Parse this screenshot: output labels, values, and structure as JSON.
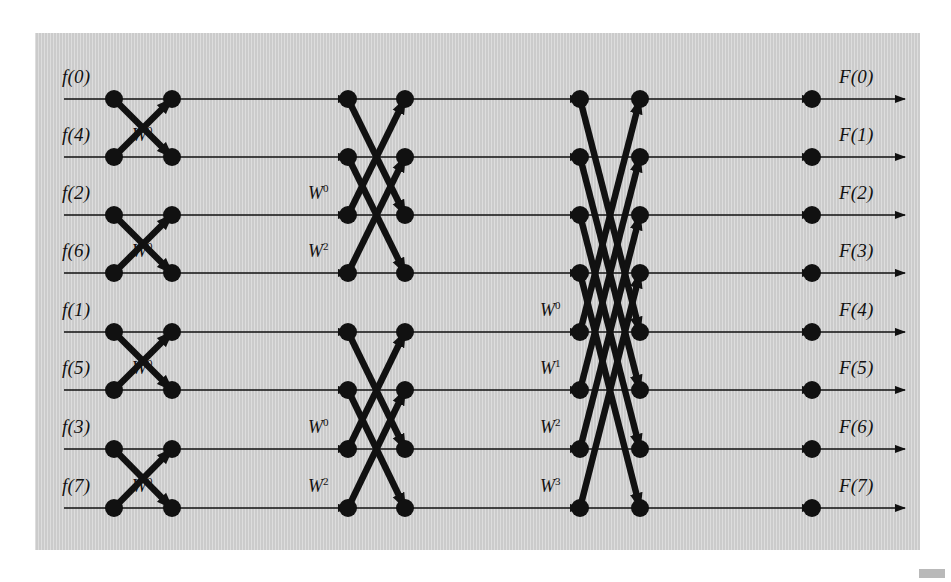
{
  "figure": {
    "kind": "fft-signal-flow-graph",
    "background_color": "#cfcfcf",
    "page_background_color": "#ffffff",
    "line_color": "#111111",
    "node_color": "#111111",
    "panel": {
      "x": 35,
      "y": 33,
      "width": 885,
      "height": 517
    }
  },
  "geometry": {
    "rows_y": [
      99,
      157,
      215,
      273,
      332,
      390,
      449,
      508
    ],
    "columns_x": [
      114,
      172,
      348,
      405,
      580,
      640,
      812
    ],
    "input_line_start_x": 64,
    "output_line_end_x": 905,
    "node_radius": 9,
    "thin_line_width": 1.6,
    "thick_line_width": 6.5
  },
  "inputs": {
    "label_prefix": "f",
    "labels": [
      "f(0)",
      "f(4)",
      "f(2)",
      "f(6)",
      "f(1)",
      "f(5)",
      "f(3)",
      "f(7)"
    ],
    "bit_reversed_order": [
      0,
      4,
      2,
      6,
      1,
      5,
      3,
      7
    ]
  },
  "outputs": {
    "label_prefix": "F",
    "labels": [
      "F(0)",
      "F(1)",
      "F(2)",
      "F(3)",
      "F(4)",
      "F(5)",
      "F(6)",
      "F(7)"
    ],
    "natural_order": [
      0,
      1,
      2,
      3,
      4,
      5,
      6,
      7
    ]
  },
  "twiddle_labels": {
    "stage1": [
      {
        "row": 2,
        "text": "W",
        "exponent": "0"
      },
      {
        "row": 4,
        "text": "W",
        "exponent": "0"
      },
      {
        "row": 6,
        "text": "W",
        "exponent": "0"
      },
      {
        "row": 8,
        "text": "W",
        "exponent": "0"
      }
    ],
    "stage2": [
      {
        "row": 3,
        "text": "W",
        "exponent": "0"
      },
      {
        "row": 4,
        "text": "W",
        "exponent": "2"
      },
      {
        "row": 7,
        "text": "W",
        "exponent": "0"
      },
      {
        "row": 8,
        "text": "W",
        "exponent": "2"
      }
    ],
    "stage3": [
      {
        "row": 5,
        "text": "W",
        "exponent": "0"
      },
      {
        "row": 6,
        "text": "W",
        "exponent": "1"
      },
      {
        "row": 7,
        "text": "W",
        "exponent": "2"
      },
      {
        "row": 8,
        "text": "W",
        "exponent": "3"
      }
    ]
  },
  "stages": [
    {
      "name": "stage-1",
      "span": 1,
      "from_col": 1,
      "to_col": 2,
      "pairs": [
        [
          1,
          2
        ],
        [
          3,
          4
        ],
        [
          5,
          6
        ],
        [
          7,
          8
        ]
      ]
    },
    {
      "name": "stage-2",
      "span": 2,
      "from_col": 3,
      "to_col": 4,
      "pairs": [
        [
          1,
          3
        ],
        [
          2,
          4
        ],
        [
          5,
          7
        ],
        [
          6,
          8
        ]
      ]
    },
    {
      "name": "stage-3",
      "span": 4,
      "from_col": 5,
      "to_col": 6,
      "pairs": [
        [
          1,
          5
        ],
        [
          2,
          6
        ],
        [
          3,
          7
        ],
        [
          4,
          8
        ]
      ]
    }
  ]
}
